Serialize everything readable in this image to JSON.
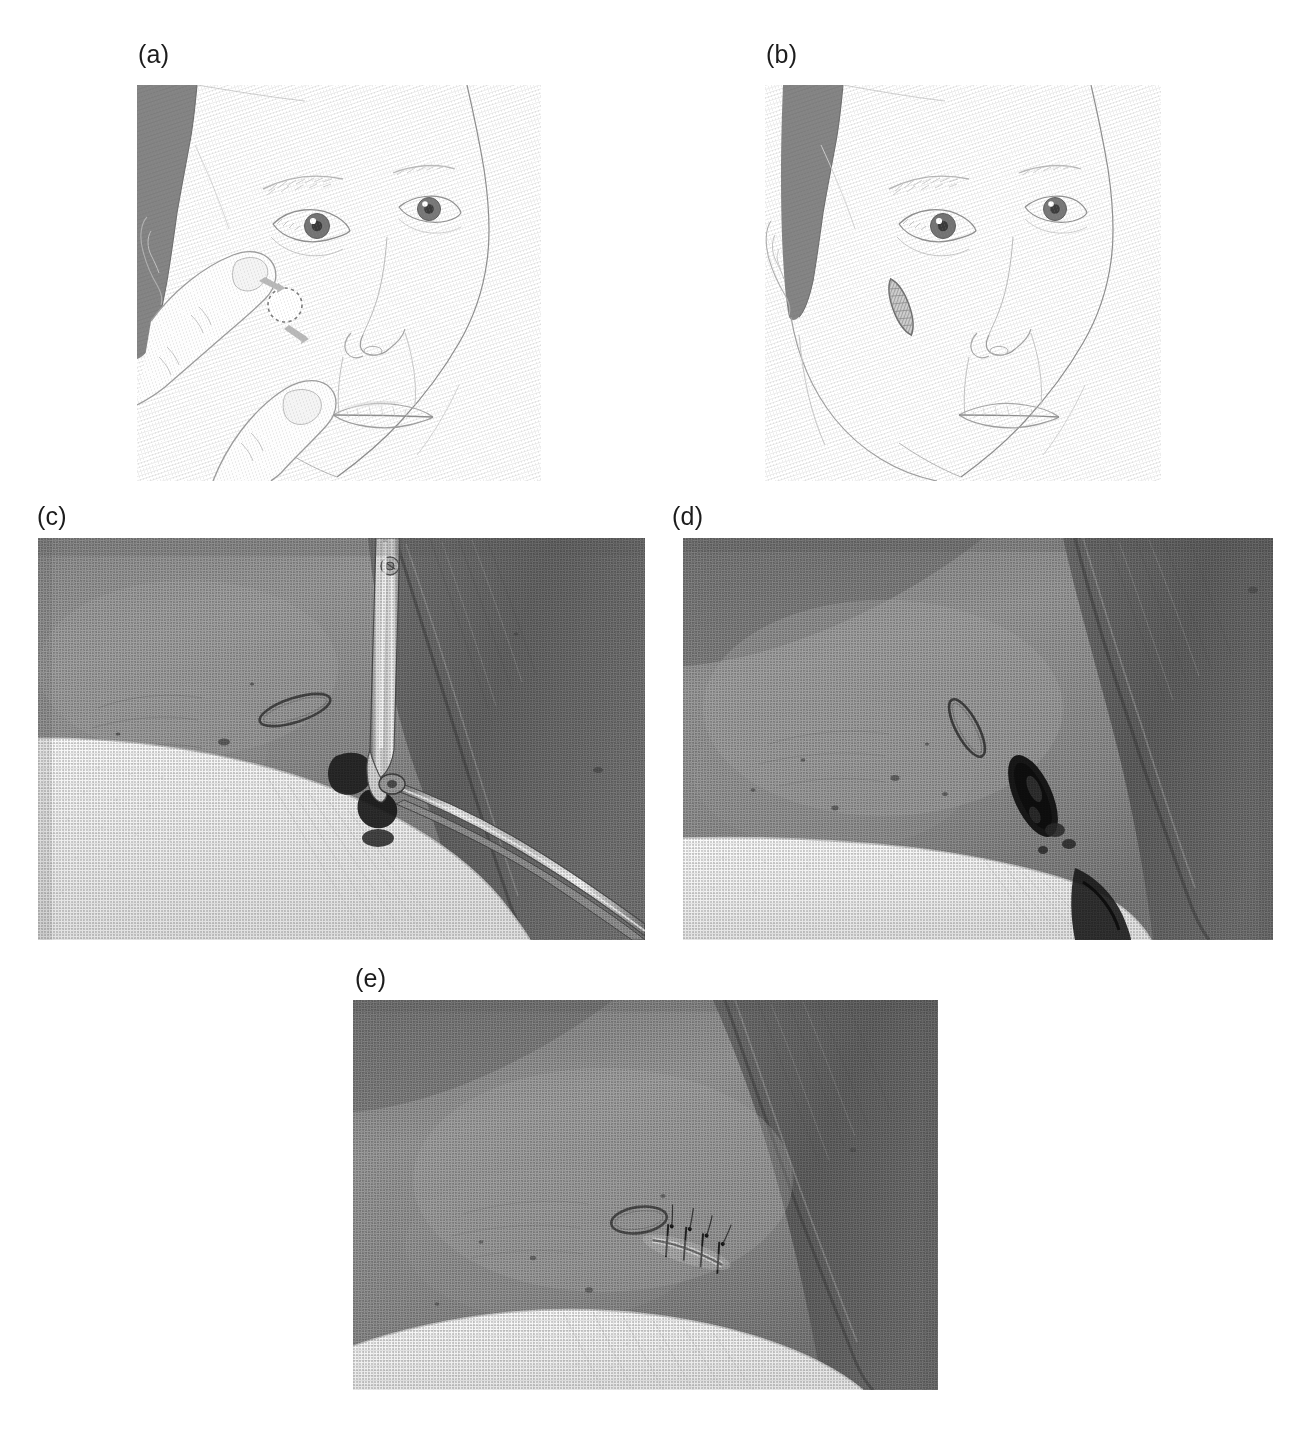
{
  "figure": {
    "type": "multi-panel clinical figure",
    "background_color": "#ffffff",
    "width": 1302,
    "height": 1444,
    "panel_count": 5
  },
  "panels": [
    {
      "key": "a",
      "label": "(a)",
      "kind": "line-illustration",
      "subject": "Three-quarter view of a face; index finger above and thumb below stretch the cheek skin to demonstrate relaxed skin tension lines; a dashed circle marks the lesion with opposing tension arrows.",
      "x": 137,
      "y": 85,
      "w": 404,
      "h": 396,
      "label_x": 138,
      "label_y": 42,
      "markers": {
        "lesion_marker": "dashed-circle",
        "tension_arrows": 2,
        "stretch_fingers": 2
      },
      "colors": {
        "hair": "#848484",
        "skin_line": "#9a9a9a",
        "outline": "#8d8d8d",
        "iris": "#6f6f6f"
      }
    },
    {
      "key": "b",
      "label": "(b)",
      "kind": "line-illustration",
      "subject": "Same face without the stretching fingers; a shaded fusiform (elliptical) excision is drawn on the cheek, its long axis aligned with the relaxed skin tension line.",
      "x": 765,
      "y": 85,
      "w": 396,
      "h": 396,
      "label_x": 766,
      "label_y": 42,
      "markers": {
        "lesion_marker": "fusiform-ellipse",
        "ellipse_angle_deg": -22
      },
      "colors": {
        "hair": "#848484",
        "skin_line": "#9a9a9a",
        "outline": "#8d8d8d",
        "iris": "#6f6f6f"
      }
    },
    {
      "key": "c",
      "label": "(c)",
      "kind": "photograph",
      "subject": "Black-and-white intraoperative photograph: toothed forceps and fine scissors grasp and undercut the marked lesion on the skin; white gauze drape lies below the operative field.",
      "x": 38,
      "y": 538,
      "w": 607,
      "h": 402,
      "label_x": 37,
      "label_y": 504,
      "features": [
        "forceps",
        "scissors",
        "marked-ellipse",
        "gauze-drape",
        "skin-crease"
      ],
      "colors": {
        "skin_mid": "#8b8b8b",
        "skin_dark": "#5d5d5d",
        "gauze": "#f2f2f2",
        "instrument": "#d8d8d8"
      }
    },
    {
      "key": "d",
      "label": "(d)",
      "kind": "photograph",
      "subject": "Black-and-white photograph after excision: the open surgical defect appears as a dark elliptical wound beside the ink-marked ellipse; blood-stained gauze at lower right.",
      "x": 683,
      "y": 538,
      "w": 590,
      "h": 402,
      "label_x": 672,
      "label_y": 504,
      "features": [
        "open-defect",
        "marked-ellipse",
        "gauze-drape",
        "blood-stain"
      ],
      "colors": {
        "skin_mid": "#8b8b8b",
        "skin_dark": "#5a5a5a",
        "gauze": "#f4f4f4",
        "wound": "#1d1d1d"
      }
    },
    {
      "key": "e",
      "label": "(e)",
      "kind": "photograph",
      "subject": "Black-and-white photograph of the closed wound: the defect has been approximated with interrupted sutures producing a short linear scar; white gauze drape below.",
      "x": 353,
      "y": 1000,
      "w": 585,
      "h": 390,
      "label_x": 355,
      "label_y": 966,
      "features": [
        "sutured-wound",
        "interrupted-sutures",
        "marked-ellipse",
        "gauze-drape"
      ],
      "suture_count": 4,
      "colors": {
        "skin_mid": "#8d8d8d",
        "skin_dark": "#5f5f5f",
        "gauze": "#f5f5f5",
        "suture": "#2a2a2a"
      }
    }
  ]
}
